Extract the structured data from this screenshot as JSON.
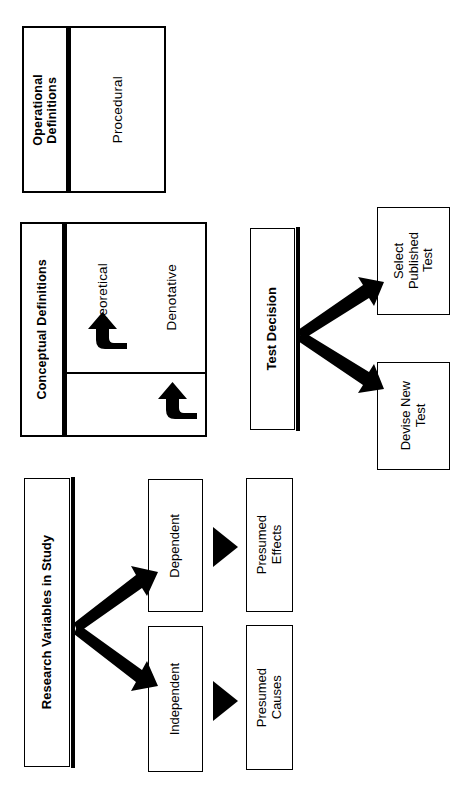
{
  "figure": {
    "orientation": "rotated-90-ccw",
    "ink_color": "#000000",
    "paper_color": "#ffffff"
  },
  "groups": {
    "operational": {
      "heading": "Operational\nDefinitions",
      "items": [
        "Procedural"
      ]
    },
    "conceptual": {
      "heading": "Conceptual Definitions",
      "items": [
        "Theoretical",
        "Denotative"
      ],
      "arrows": [
        "curved-arrow-theoretical",
        "curved-arrow-denotative"
      ]
    }
  },
  "test_decision": {
    "heading": "Test Decision",
    "outcomes": [
      {
        "label": "Select\nPublished\nTest"
      },
      {
        "label": "Devise New\nTest"
      }
    ]
  },
  "research_variables": {
    "heading": "Research Variables in Study",
    "branches": [
      {
        "variable": "Dependent",
        "implies": "Presumed\nEffects"
      },
      {
        "variable": "Independent",
        "implies": "Presumed\nCauses"
      }
    ]
  }
}
